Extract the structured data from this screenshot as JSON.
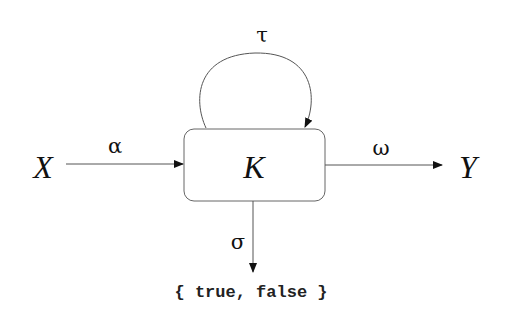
{
  "diagram": {
    "nodes": {
      "input": {
        "label": "X"
      },
      "process": {
        "label": "K"
      },
      "output": {
        "label": "Y"
      },
      "result_set": {
        "label": "{ true, false }"
      }
    },
    "edges": {
      "input_edge": {
        "from": "X",
        "to": "K",
        "label": "α"
      },
      "output_edge": {
        "from": "K",
        "to": "Y",
        "label": "ω"
      },
      "self_loop": {
        "from": "K",
        "to": "K",
        "label": "τ"
      },
      "result_edge": {
        "from": "K",
        "to": "{ true, false }",
        "label": "σ"
      }
    },
    "colors": {
      "line": "#555555",
      "arrowhead": "#111111",
      "text": "#111111",
      "box_border": "#666666"
    }
  }
}
